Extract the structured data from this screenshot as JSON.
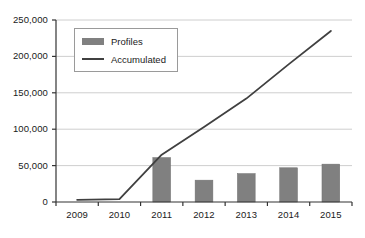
{
  "chart_data": {
    "type": "bar",
    "title": "",
    "subtitle": "",
    "xlabel": "",
    "ylabel": "",
    "categories": [
      "2009",
      "2010",
      "2011",
      "2012",
      "2013",
      "2014",
      "2015"
    ],
    "ylim": [
      0,
      250000
    ],
    "ytick_values": [
      0,
      50000,
      100000,
      150000,
      200000,
      250000
    ],
    "ytick_labels": [
      "0",
      "50,000",
      "100,000",
      "150,000",
      "200,000",
      "250,000"
    ],
    "grid": true,
    "legend_position": "upper-left",
    "series": [
      {
        "name": "Profiles",
        "type": "bar",
        "color": "#808080",
        "values": [
          0,
          0,
          61000,
          30000,
          39000,
          47000,
          52000
        ]
      },
      {
        "name": "Accumulated",
        "type": "line",
        "color": "#404040",
        "values": [
          3000,
          4000,
          65000,
          103000,
          142000,
          189000,
          235000
        ]
      }
    ]
  },
  "legend": {
    "items": [
      {
        "label": "Profiles",
        "marker": "bar-swatch"
      },
      {
        "label": "Accumulated",
        "marker": "line-swatch"
      }
    ]
  },
  "colors": {
    "bar": "#808080",
    "line": "#404040",
    "grid": "#c8c8c8",
    "axis": "#333333",
    "text": "#1a1a1a",
    "background": "#ffffff"
  }
}
